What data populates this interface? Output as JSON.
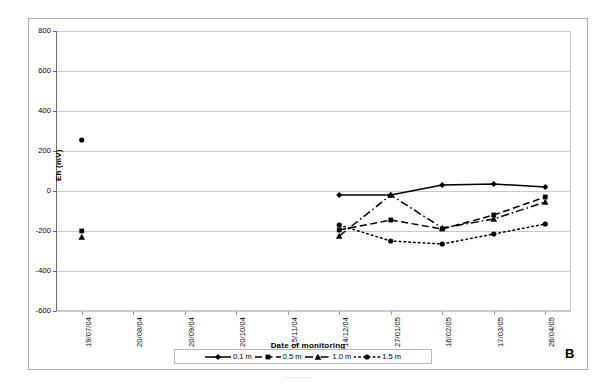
{
  "figure": {
    "panel_label": "B",
    "caption_fragment": "~~~~~ ~~"
  },
  "axes": {
    "ylabel": "Eh (mV)",
    "xlabel": "Date of monitoring",
    "yticks": [
      800,
      600,
      400,
      200,
      0,
      -200,
      -400,
      -600
    ],
    "ytick_labels": [
      "800",
      "600",
      "400",
      "200",
      "0",
      "-200",
      "-400",
      "-600"
    ],
    "ylim": [
      -600,
      800
    ],
    "xtick_labels": [
      "19/07/04",
      "20/08/04",
      "20/09/04",
      "20/10/04",
      "15/11/04",
      "14/12/04",
      "27/01/05",
      "16/02/05",
      "17/03/05",
      "26/04/05"
    ]
  },
  "legend": {
    "position": "bottom-center",
    "entries": [
      {
        "label": "0.1 m",
        "marker": "diamond-marker",
        "dash": "solid",
        "color": "#000000"
      },
      {
        "label": "0.5 m",
        "marker": "square-marker",
        "dash": "dashed",
        "color": "#000000"
      },
      {
        "label": "1.0 m",
        "marker": "triangle-marker",
        "dash": "dashdot",
        "color": "#000000"
      },
      {
        "label": "1.5 m",
        "marker": "circle-marker",
        "dash": "dotted",
        "color": "#000000"
      }
    ]
  },
  "chart_data": {
    "type": "line",
    "title": "",
    "xlabel": "Date of monitoring",
    "ylabel": "Eh (mV)",
    "ylim": [
      -600,
      800
    ],
    "grid": true,
    "legend_position": "bottom-center",
    "categories": [
      "19/07/04",
      "20/08/04",
      "20/09/04",
      "20/10/04",
      "15/11/04",
      "14/12/04",
      "27/01/05",
      "16/02/05",
      "17/03/05",
      "26/04/05"
    ],
    "series": [
      {
        "name": "0.1 m",
        "marker": "diamond",
        "dash": "solid",
        "values": [
          null,
          null,
          null,
          null,
          null,
          -20,
          -20,
          30,
          35,
          20
        ]
      },
      {
        "name": "0.5 m",
        "marker": "square",
        "dash": "dashed",
        "values": [
          -200,
          null,
          null,
          null,
          null,
          -195,
          -145,
          -190,
          -120,
          -30
        ]
      },
      {
        "name": "1.0 m",
        "marker": "triangle",
        "dash": "dashdot",
        "values": [
          -230,
          null,
          null,
          null,
          null,
          -225,
          -20,
          -185,
          -140,
          -55
        ]
      },
      {
        "name": "1.5 m",
        "marker": "circle",
        "dash": "dotted",
        "values": [
          255,
          null,
          null,
          null,
          null,
          -170,
          -250,
          -265,
          -215,
          -165
        ]
      }
    ]
  }
}
